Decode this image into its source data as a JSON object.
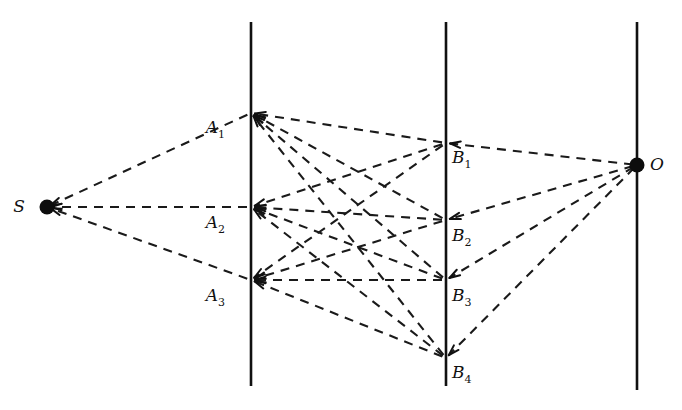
{
  "figure": {
    "kind": "bipartite-ray-path-diagram",
    "background_color": "#ffffff",
    "stroke_color": "#111111",
    "width": 682,
    "height": 410
  },
  "style": {
    "dash_pattern": "9 7",
    "ray_stroke_width": 2.1,
    "plane_stroke_width": 2.6,
    "arrow_direction": "right-to-left (from observer O toward source S)"
  },
  "planes": [
    {
      "name": "plane-1",
      "x": 251,
      "y_top": 22,
      "y_bottom": 386
    },
    {
      "name": "plane-2",
      "x": 446,
      "y_top": 22,
      "y_bottom": 386
    },
    {
      "name": "plane-3",
      "x": 637,
      "y_top": 22,
      "y_bottom": 390
    }
  ],
  "nodes": [
    {
      "id": "S",
      "label": "S",
      "sub": "",
      "x": 47,
      "y": 207,
      "dot": true,
      "label_dx": -22,
      "label_dy": 5
    },
    {
      "id": "A1",
      "label": "A",
      "sub": "1",
      "x": 251,
      "y": 113,
      "dot": false,
      "label_dx": -26,
      "label_dy": 20
    },
    {
      "id": "A2",
      "label": "A",
      "sub": "2",
      "x": 251,
      "y": 207,
      "dot": false,
      "label_dx": -26,
      "label_dy": 21
    },
    {
      "id": "A3",
      "label": "A",
      "sub": "3",
      "x": 251,
      "y": 280,
      "dot": false,
      "label_dx": -26,
      "label_dy": 21
    },
    {
      "id": "B1",
      "label": "B",
      "sub": "1",
      "x": 446,
      "y": 143,
      "dot": false,
      "label_dx": 6,
      "label_dy": 20
    },
    {
      "id": "B2",
      "label": "B",
      "sub": "2",
      "x": 446,
      "y": 220,
      "dot": false,
      "label_dx": 6,
      "label_dy": 21
    },
    {
      "id": "B3",
      "label": "B",
      "sub": "3",
      "x": 446,
      "y": 280,
      "dot": false,
      "label_dx": 6,
      "label_dy": 21
    },
    {
      "id": "B4",
      "label": "B",
      "sub": "4",
      "x": 446,
      "y": 358,
      "dot": false,
      "label_dx": 6,
      "label_dy": 20
    },
    {
      "id": "O",
      "label": "O",
      "sub": "",
      "x": 637,
      "y": 165,
      "dot": true,
      "label_dx": 13,
      "label_dy": 5
    }
  ],
  "edges": [
    {
      "from": "A1",
      "to": "S",
      "arrow": true
    },
    {
      "from": "A2",
      "to": "S",
      "arrow": true
    },
    {
      "from": "A3",
      "to": "S",
      "arrow": true
    },
    {
      "from": "B1",
      "to": "A1",
      "arrow": true
    },
    {
      "from": "B2",
      "to": "A1",
      "arrow": true
    },
    {
      "from": "B3",
      "to": "A1",
      "arrow": true
    },
    {
      "from": "B4",
      "to": "A1",
      "arrow": true
    },
    {
      "from": "B1",
      "to": "A2",
      "arrow": true
    },
    {
      "from": "B2",
      "to": "A2",
      "arrow": true
    },
    {
      "from": "B3",
      "to": "A2",
      "arrow": true
    },
    {
      "from": "B4",
      "to": "A2",
      "arrow": true
    },
    {
      "from": "B1",
      "to": "A3",
      "arrow": true
    },
    {
      "from": "B2",
      "to": "A3",
      "arrow": true
    },
    {
      "from": "B3",
      "to": "A3",
      "arrow": true
    },
    {
      "from": "B4",
      "to": "A3",
      "arrow": true
    },
    {
      "from": "O",
      "to": "B1",
      "arrow": true
    },
    {
      "from": "O",
      "to": "B2",
      "arrow": true
    },
    {
      "from": "O",
      "to": "B3",
      "arrow": true
    },
    {
      "from": "O",
      "to": "B4",
      "arrow": true
    }
  ]
}
